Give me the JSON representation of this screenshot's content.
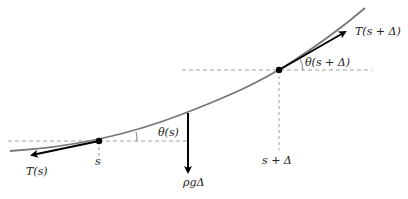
{
  "diagram": {
    "curve_color": "#777777",
    "arrow_color": "#000000",
    "dash_color": "#888888",
    "points": [
      {
        "name": "point-s",
        "x": 99,
        "y": 141
      },
      {
        "name": "point-s-plus-delta",
        "x": 279,
        "y": 70
      }
    ],
    "labels": {
      "tension_left": "T(s)",
      "tension_right": "T(s + Δ)",
      "angle_left": "θ(s)",
      "angle_right": "θ(s + Δ)",
      "weight": "ρgΔ",
      "pos_left": "s",
      "pos_right": "s + Δ"
    }
  }
}
